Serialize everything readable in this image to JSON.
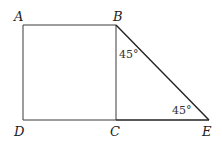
{
  "figure": {
    "points": {
      "A": {
        "label": "A",
        "x": 23,
        "y": 25
      },
      "B": {
        "label": "B",
        "x": 116,
        "y": 25
      },
      "C": {
        "label": "C",
        "x": 116,
        "y": 120
      },
      "D": {
        "label": "D",
        "x": 23,
        "y": 120
      },
      "E": {
        "label": "E",
        "x": 209,
        "y": 120
      }
    },
    "angles": {
      "at_B": "45°",
      "at_E": "45°"
    },
    "stroke_color": "#333333"
  }
}
